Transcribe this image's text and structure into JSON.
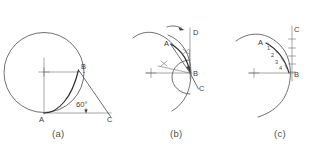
{
  "figure": {
    "background_color": "#ffffff",
    "line_color": "#4a4a4a",
    "dark_line_color": "#2b2b2b",
    "text_color": "#3a3a3a",
    "width": 316,
    "height": 153
  },
  "panels": [
    {
      "id": "a",
      "caption": "(a)",
      "caption_pos": {
        "x": 52,
        "y": 137
      },
      "center_mark": {
        "x": 44,
        "y": 72,
        "label": "+"
      },
      "circle": {
        "cx": 44,
        "cy": 72.5,
        "r": 40
      },
      "points": [
        {
          "name": "A",
          "label": "A",
          "x": 44,
          "y": 113,
          "label_x": 39,
          "label_y": 122
        },
        {
          "name": "B",
          "label": "B",
          "x": 78.5,
          "y": 70,
          "label_x": 81,
          "label_y": 69
        },
        {
          "name": "C",
          "label": "C",
          "x": 106,
          "y": 113,
          "label_x": 107,
          "label_y": 122
        }
      ],
      "angle": {
        "value": "60",
        "unit": "°",
        "text": "60°",
        "x": 84,
        "y": 105,
        "at_point": "C"
      },
      "lines": [
        {
          "name": "radius-to-B",
          "from": [
            44,
            72
          ],
          "to": [
            79,
            72
          ]
        },
        {
          "name": "vertical-A-center",
          "from": [
            44,
            58
          ],
          "to": [
            44,
            113
          ]
        },
        {
          "name": "baseline-A-C",
          "from": [
            44,
            113
          ],
          "to": [
            110,
            113
          ]
        },
        {
          "name": "hypotenuse-B-C",
          "from": [
            78.5,
            70
          ],
          "to": [
            110,
            117
          ]
        }
      ],
      "curve": {
        "name": "tangent-arc-A-B",
        "from": [
          44,
          113
        ],
        "to": [
          78.5,
          70
        ]
      }
    },
    {
      "id": "b",
      "caption": "(b)",
      "caption_pos": {
        "x": 170,
        "y": 137
      },
      "center_mark": {
        "x": 151,
        "y": 73,
        "label": "+"
      },
      "points": [
        {
          "name": "A",
          "label": "A",
          "x": 172,
          "y": 43,
          "label_x": 165,
          "label_y": 45
        },
        {
          "name": "B",
          "label": "B",
          "x": 190,
          "y": 73,
          "label_x": 193,
          "label_y": 75
        },
        {
          "name": "C",
          "label": "C",
          "x": 196,
          "y": 87,
          "label_x": 199,
          "label_y": 90
        },
        {
          "name": "D",
          "label": "D",
          "x": 190,
          "y": 33,
          "label_x": 193,
          "label_y": 33
        }
      ],
      "tick_marks": [
        {
          "name": "tick-upper-right",
          "x": 186,
          "y": 52
        },
        {
          "name": "tick-lower-left",
          "x": 164,
          "y": 64
        }
      ],
      "direction_arrow": {
        "name": "rotation-arrow",
        "from": [
          168,
          26
        ],
        "to": [
          183,
          29
        ]
      },
      "lines": [
        {
          "name": "horizontal-center-B",
          "from": [
            146,
            73
          ],
          "to": [
            192,
            73
          ]
        },
        {
          "name": "vertical-B-D",
          "from": [
            190,
            28
          ],
          "to": [
            190,
            78
          ]
        },
        {
          "name": "chord-B-A",
          "from": [
            190,
            73
          ],
          "to": [
            170,
            44
          ]
        },
        {
          "name": "chord-B-C",
          "from": [
            190,
            73
          ],
          "to": [
            198,
            89
          ]
        }
      ],
      "arcs": [
        {
          "name": "large-outer-arc",
          "description": "wide arc sweeping from left through A"
        },
        {
          "name": "small-construction-arc",
          "description": "small circle arc centered near B region"
        },
        {
          "name": "swing-arc-A-to-D",
          "description": "arc swinging point A up to line BD"
        }
      ]
    },
    {
      "id": "c",
      "caption": "(c)",
      "caption_pos": {
        "x": 274,
        "y": 137
      },
      "center_mark": {
        "x": 254,
        "y": 73,
        "label": "+"
      },
      "points": [
        {
          "name": "A",
          "label": "A",
          "x": 265,
          "y": 43,
          "label_x": 259,
          "label_y": 43
        },
        {
          "name": "B",
          "label": "B",
          "x": 292,
          "y": 73,
          "label_x": 295,
          "label_y": 75
        },
        {
          "name": "C",
          "label": "C",
          "x": 292,
          "y": 30,
          "label_x": 295,
          "label_y": 30
        }
      ],
      "division_labels": [
        "1",
        "2",
        "3",
        "4"
      ],
      "division_positions": [
        {
          "label": "1",
          "x": 270,
          "y": 48
        },
        {
          "label": "2",
          "x": 274,
          "y": 55
        },
        {
          "label": "3",
          "x": 277,
          "y": 62
        },
        {
          "label": "4",
          "x": 280,
          "y": 68
        }
      ],
      "lines": [
        {
          "name": "horizontal-center-B",
          "from": [
            248,
            73
          ],
          "to": [
            294,
            73
          ]
        },
        {
          "name": "vertical-B-C",
          "from": [
            292,
            26
          ],
          "to": [
            292,
            80
          ]
        }
      ],
      "scale_ticks_on_vertical": 5,
      "arcs": [
        {
          "name": "large-outer-arc",
          "description": "wide arc sweeping from left through A down past B"
        },
        {
          "name": "divided-arc-A-B",
          "description": "arc from A to B divided into 4 equal parts"
        }
      ]
    }
  ]
}
